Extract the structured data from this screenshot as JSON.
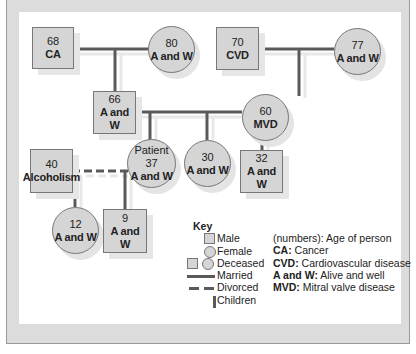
{
  "caption": "",
  "colors": {
    "node_fill": "#d5d5d5",
    "line": "#5a5a5a",
    "frame": "#dcdcdc"
  },
  "nodes": {
    "gp_paternal_m": {
      "age": "68",
      "condition": "CA",
      "shape": "square"
    },
    "gp_paternal_f": {
      "age": "80",
      "condition": "A and W",
      "shape": "circle"
    },
    "gp_maternal_m": {
      "age": "70",
      "condition": "CVD",
      "shape": "square"
    },
    "gp_maternal_f": {
      "age": "77",
      "condition": "A and W",
      "shape": "circle"
    },
    "father": {
      "age": "66",
      "condition": "A and W",
      "shape": "square"
    },
    "mother": {
      "age": "60",
      "condition": "MVD",
      "shape": "circle"
    },
    "ex_spouse": {
      "age": "40",
      "condition": "Alcoholism",
      "shape": "square"
    },
    "patient": {
      "label": "Patient",
      "age": "37",
      "condition": "A and W",
      "shape": "circle"
    },
    "sister": {
      "age": "30",
      "condition": "A and W",
      "shape": "circle"
    },
    "brother": {
      "age": "32",
      "condition": "A and W",
      "shape": "square"
    },
    "daughter": {
      "age": "12",
      "condition": "A and W",
      "shape": "circle"
    },
    "son": {
      "age": "9",
      "condition": "A and W",
      "shape": "square"
    }
  },
  "key": {
    "title": "Key",
    "items": [
      {
        "symbol": "square",
        "label": "Male"
      },
      {
        "symbol": "circle",
        "label": "Female"
      },
      {
        "symbol": "square+circle",
        "label": "Deceased"
      },
      {
        "symbol": "solid-line",
        "label": "Married"
      },
      {
        "symbol": "dashed-line",
        "label": "Divorced"
      },
      {
        "symbol": "vertical-line",
        "label": "Children"
      }
    ]
  },
  "abbreviations": [
    {
      "term": "",
      "text": "(numbers): Age of person"
    },
    {
      "term": "CA:",
      "text": " Cancer"
    },
    {
      "term": "CVD:",
      "text": " Cardiovascular disease"
    },
    {
      "term": "A and W:",
      "text": " Alive and well"
    },
    {
      "term": "MVD:",
      "text": " Mitral valve disease"
    }
  ]
}
